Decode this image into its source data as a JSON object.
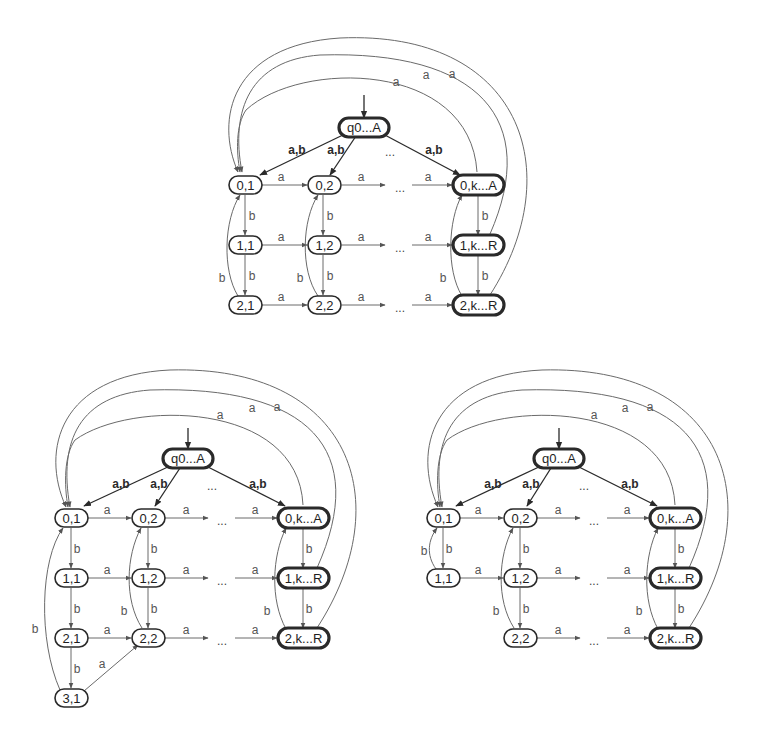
{
  "figure": {
    "type": "state-diagrams",
    "count": 3
  },
  "symbols": {
    "a": "a",
    "b": "b",
    "ab": "a,b",
    "ellipsis": "..."
  },
  "diagrams": [
    {
      "id": "top",
      "start": "q0...A",
      "nodes": {
        "q0": "q0...A",
        "n01": "0,1",
        "n02": "0,2",
        "n0k": "0,k...A",
        "n11": "1,1",
        "n12": "1,2",
        "n1k": "1,k...R",
        "n21": "2,1",
        "n22": "2,2",
        "n2k": "2,k...R"
      },
      "final_states": [
        "q0...A",
        "0,k...A",
        "1,k...R",
        "2,k...R"
      ]
    },
    {
      "id": "bottom-left",
      "start": "q0...A",
      "nodes": {
        "q0": "q0...A",
        "n01": "0,1",
        "n02": "0,2",
        "n0k": "0,k...A",
        "n11": "1,1",
        "n12": "1,2",
        "n1k": "1,k...R",
        "n21": "2,1",
        "n22": "2,2",
        "n2k": "2,k...R",
        "n31": "3,1"
      },
      "final_states": [
        "q0...A",
        "0,k...A",
        "1,k...R",
        "2,k...R"
      ]
    },
    {
      "id": "bottom-right",
      "start": "q0...A",
      "nodes": {
        "q0": "q0...A",
        "n01": "0,1",
        "n02": "0,2",
        "n0k": "0,k...A",
        "n11": "1,1",
        "n12": "1,2",
        "n1k": "1,k...R",
        "n22": "2,2",
        "n2k": "2,k...R"
      },
      "final_states": [
        "q0...A",
        "0,k...A",
        "1,k...R",
        "2,k...R"
      ]
    }
  ],
  "colors": {
    "node_stroke": "#2a2a2a",
    "edge": "#6a6a6a",
    "background": "#ffffff"
  }
}
